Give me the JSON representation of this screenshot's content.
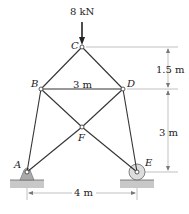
{
  "diagram": {
    "type": "truss",
    "load": {
      "label": "8 kN",
      "node": "C",
      "direction": "down"
    },
    "nodes": [
      {
        "id": "A",
        "label": "A",
        "x": 27,
        "y": 172
      },
      {
        "id": "B",
        "label": "B",
        "x": 41,
        "y": 89
      },
      {
        "id": "C",
        "label": "C",
        "x": 82,
        "y": 47
      },
      {
        "id": "D",
        "label": "D",
        "x": 123,
        "y": 89
      },
      {
        "id": "E",
        "label": "E",
        "x": 137,
        "y": 172
      },
      {
        "id": "F",
        "label": "F",
        "x": 82,
        "y": 127
      }
    ],
    "members": [
      [
        "A",
        "B"
      ],
      [
        "B",
        "C"
      ],
      [
        "C",
        "D"
      ],
      [
        "D",
        "E"
      ],
      [
        "B",
        "D"
      ],
      [
        "A",
        "F"
      ],
      [
        "F",
        "D"
      ],
      [
        "B",
        "F"
      ],
      [
        "F",
        "E"
      ]
    ],
    "supports": {
      "A": "pin",
      "E": "roller"
    },
    "dimensions": {
      "bd_span": "3 m",
      "upper_height": "1.5 m",
      "lower_height": "3 m",
      "base_span": "4 m"
    }
  }
}
